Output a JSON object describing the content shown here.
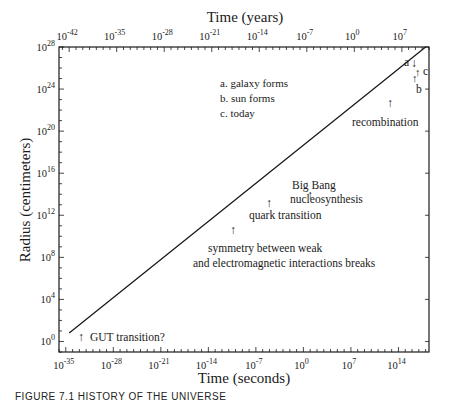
{
  "chart_data": {
    "type": "line",
    "title": "",
    "xlabel": "Time (seconds)",
    "x2label": "Time (years)",
    "ylabel": "Radius (centimeters)",
    "xscale": "log",
    "yscale": "log",
    "x_ticks": [
      "10^-35",
      "10^-28",
      "10^-21",
      "10^-14",
      "10^-7",
      "10^0",
      "10^7",
      "10^14"
    ],
    "x_tick_exponents": [
      -35,
      -28,
      -21,
      -14,
      -7,
      0,
      7,
      14
    ],
    "x2_ticks": [
      "10^-42",
      "10^-35",
      "10^-28",
      "10^-21",
      "10^-14",
      "10^-7",
      "10^0",
      "10^7"
    ],
    "x2_tick_exponents": [
      -42,
      -35,
      -28,
      -21,
      -14,
      -7,
      0,
      7
    ],
    "y_ticks": [
      "10^0",
      "10^4",
      "10^8",
      "10^12",
      "10^16",
      "10^20",
      "10^24",
      "10^28"
    ],
    "y_tick_exponents": [
      0,
      4,
      8,
      12,
      16,
      20,
      24,
      28
    ],
    "xlim_exp": [
      -36,
      18.5
    ],
    "ylim_exp": [
      -1,
      28
    ],
    "grid": false,
    "series": [
      {
        "name": "Radius of universe",
        "x_exp": [
          -34.5,
          12.8,
          18.0
        ],
        "y_exp": [
          0.8,
          25.3,
          28.0
        ]
      }
    ],
    "legend": {
      "entries": [
        "a. galaxy forms",
        "b. sun forms",
        "c. today"
      ],
      "position": "upper-left-center"
    },
    "annotations": [
      {
        "text": "GUT transition?",
        "arrow": "up"
      },
      {
        "text": "symmetry between weak",
        "arrow": "up"
      },
      {
        "text": "and electromagnetic interactions breaks",
        "arrow": "none"
      },
      {
        "text": "quark transition",
        "arrow": "up"
      },
      {
        "text": "Big Bang",
        "arrow": "up"
      },
      {
        "text": "nucleosynthesis",
        "arrow": "none"
      },
      {
        "text": "recombination",
        "arrow": "up"
      },
      {
        "text": "a",
        "arrow": "down"
      },
      {
        "text": "b",
        "arrow": "up"
      },
      {
        "text": "c",
        "arrow": "up"
      }
    ]
  },
  "labels": {
    "top_axis_title": "Time (years)",
    "bottom_axis_title": "Time (seconds)",
    "left_axis_title": "Radius (centimeters)",
    "legend_a": "a. galaxy forms",
    "legend_b": "b. sun forms",
    "legend_c": "c. today",
    "gut": "GUT transition?",
    "sym1": "symmetry between weak",
    "sym2": "and electromagnetic interactions breaks",
    "quark": "quark transition",
    "bb1": "Big Bang",
    "bb2": "nucleosynthesis",
    "recomb": "recombination",
    "mark_a": "a",
    "mark_b": "b",
    "mark_c": "c",
    "arrow_up": "↑",
    "arrow_down": "↓",
    "base": "10",
    "caption": "FIGURE 7.1   HISTORY OF THE UNIVERSE"
  }
}
